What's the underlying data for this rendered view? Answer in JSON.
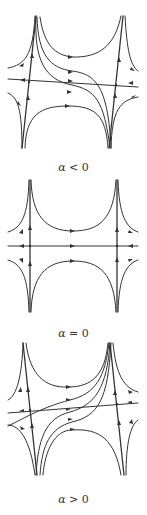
{
  "figure": {
    "panels": [
      {
        "id": "alpha-negative",
        "label_var": "α",
        "label_rel": " < 0",
        "label": "α < 0"
      },
      {
        "id": "alpha-zero",
        "label_var": "α",
        "label_rel": " = 0",
        "label": "α = 0"
      },
      {
        "id": "alpha-positive",
        "label_var": "α",
        "label_rel": " > 0",
        "label": "α > 0"
      }
    ],
    "stroke_color": "#333333",
    "background": "#ffffff"
  }
}
